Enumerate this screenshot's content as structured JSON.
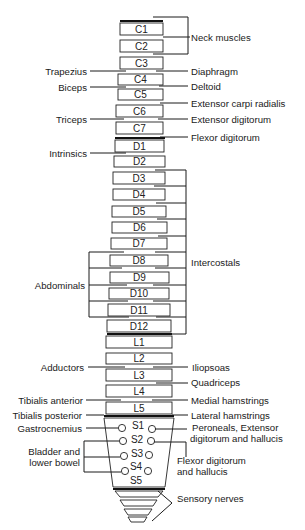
{
  "diagram": {
    "vertebrae": [
      {
        "id": "C1",
        "label": "C1"
      },
      {
        "id": "C2",
        "label": "C2"
      },
      {
        "id": "C3",
        "label": "C3"
      },
      {
        "id": "C4",
        "label": "C4"
      },
      {
        "id": "C5",
        "label": "C5"
      },
      {
        "id": "C6",
        "label": "C6"
      },
      {
        "id": "C7",
        "label": "C7"
      },
      {
        "id": "D1",
        "label": "D1"
      },
      {
        "id": "D2",
        "label": "D2"
      },
      {
        "id": "D3",
        "label": "D3"
      },
      {
        "id": "D4",
        "label": "D4"
      },
      {
        "id": "D5",
        "label": "D5"
      },
      {
        "id": "D6",
        "label": "D6"
      },
      {
        "id": "D7",
        "label": "D7"
      },
      {
        "id": "D8",
        "label": "D8"
      },
      {
        "id": "D9",
        "label": "D9"
      },
      {
        "id": "D10",
        "label": "D10"
      },
      {
        "id": "D11",
        "label": "D11"
      },
      {
        "id": "D12",
        "label": "D12"
      },
      {
        "id": "L1",
        "label": "L1"
      },
      {
        "id": "L2",
        "label": "L2"
      },
      {
        "id": "L3",
        "label": "L3"
      },
      {
        "id": "L4",
        "label": "L4"
      },
      {
        "id": "L5",
        "label": "L5"
      }
    ],
    "sacral": [
      "S1",
      "S2",
      "S3",
      "S4",
      "S5"
    ],
    "right_labels": {
      "neck_muscles": "Neck muscles",
      "diaphragm": "Diaphragm",
      "deltoid": "Deltoid",
      "extensor_carpi_radialis": "Extensor carpi radialis",
      "extensor_digitorum": "Extensor digitorum",
      "flexor_digitorum": "Flexor digitorum",
      "intercostals": "Intercostals",
      "iliopsoas": "Iliopsoas",
      "quadriceps": "Quadriceps",
      "medial_hamstrings": "Medial hamstrings",
      "lateral_hamstrings": "Lateral hamstrings",
      "peroneals_line1": "Peroneals, Extensor",
      "peroneals_line2": "digitorum and hallucis",
      "flexor_dh_line1": "Flexor digitorum",
      "flexor_dh_line2": "and hallucis",
      "sensory_nerves": "Sensory nerves"
    },
    "left_labels": {
      "trapezius": "Trapezius",
      "biceps": "Biceps",
      "triceps": "Triceps",
      "intrinsics": "Intrinsics",
      "abdominals": "Abdominals",
      "adductors": "Adductors",
      "tibialis_anterior": "Tibialis anterior",
      "tibialis_posterior": "Tibialis posterior",
      "gastrocnemius": "Gastrocnemius",
      "bladder_line1": "Bladder and",
      "bladder_line2": "lower bowel"
    }
  }
}
